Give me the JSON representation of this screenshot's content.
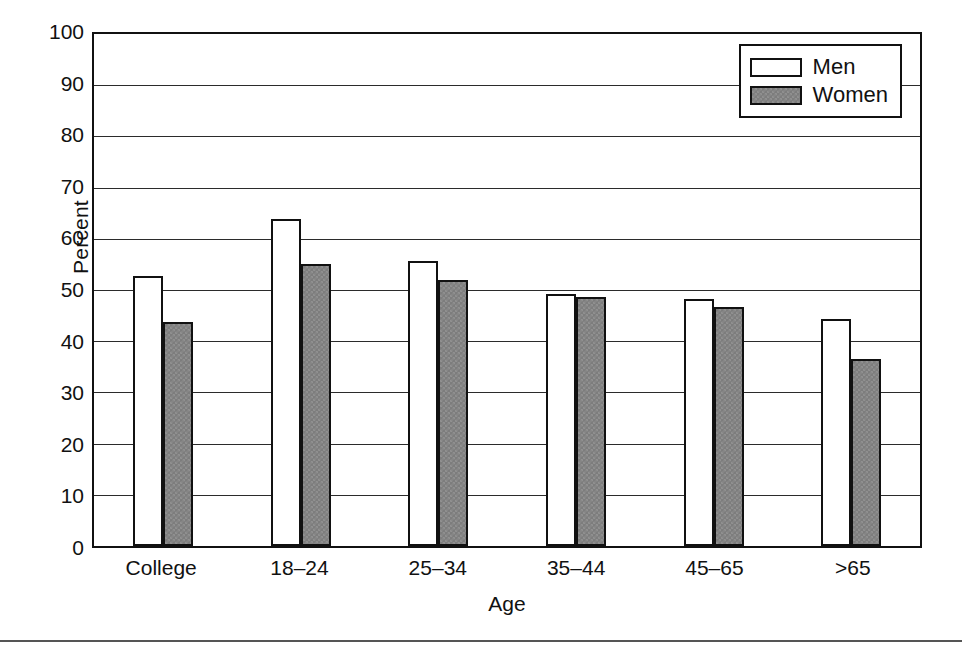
{
  "chart_data": {
    "type": "bar",
    "title": "",
    "xlabel": "Age",
    "ylabel": "Percent",
    "categories": [
      "College",
      "18–24",
      "25–34",
      "35–44",
      "45–65",
      ">65"
    ],
    "series": [
      {
        "name": "Men",
        "color": "#ffffff",
        "values": [
          52.8,
          63.8,
          55.6,
          49.2,
          48.3,
          44.4
        ]
      },
      {
        "name": "Women",
        "color": "#7d7d7d",
        "values": [
          43.8,
          55.0,
          52.0,
          48.7,
          46.7,
          36.5
        ]
      }
    ],
    "ylim": [
      0,
      100
    ],
    "ytick_step": 10,
    "yticks": [
      "100",
      "90",
      "80",
      "70",
      "60",
      "50",
      "40",
      "30",
      "20",
      "10",
      "0"
    ],
    "grid": "horizontal",
    "legend_position": "top-right-inside",
    "legend": [
      {
        "label": "Men",
        "swatch": "white-outlined"
      },
      {
        "label": "Women",
        "swatch": "gray-filled"
      }
    ]
  },
  "colors": {
    "axis": "#111111",
    "gridline": "#2b2b2b",
    "men_fill": "#ffffff",
    "women_fill": "#7d7d7d",
    "background": "#ffffff",
    "rule": "#555555"
  }
}
